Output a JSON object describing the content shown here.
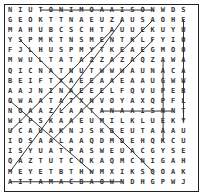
{
  "puzzle": {
    "type": "word-search",
    "rows": 18,
    "cols": 18,
    "grid": [
      "NIUTONIMOAAISONWDS",
      "GEOKTTNAEUZAUSAOHE",
      "MAHUBCSCHTAUUEKUYU",
      "YSPMKTNSMENTKLFYIO",
      "FJLHUSPMYTKEAEGMOO",
      "MWULTATAZZAZAQZAWA",
      "QICNATNUTWWWAUNACA",
      "BEIFTXAEEAAEAAUGWW",
      "AAJNINAEEELFQVUPEB",
      "OWAATATXNVOYAXQPFL",
      "NOAAZLAATANAAISNNT",
      "WLPSKAAEUMILKLUEKY",
      "UCAUAKNJSKBEUTAAAU",
      "IOSAALAAQDMDEHQKCU",
      "ISYUATPASWEUACGYSE",
      "QAZTUTCQKAQMCNIGAH",
      "MEYETBTHWMXIKSQOAK",
      "AITAMACBAOWNDHGPWJ"
    ],
    "found_lines": [
      {
        "from": [
          0,
          3
        ],
        "to": [
          0,
          14
        ],
        "dir": "horizontal"
      },
      {
        "from": [
          10,
          9
        ],
        "to": [
          10,
          16
        ],
        "dir": "horizontal"
      },
      {
        "from": [
          17,
          0
        ],
        "to": [
          17,
          11
        ],
        "dir": "horizontal"
      },
      {
        "from": [
          1,
          17
        ],
        "to": [
          11,
          17
        ],
        "dir": "vertical"
      },
      {
        "from": [
          5,
          15
        ],
        "to": [
          13,
          15
        ],
        "dir": "vertical"
      },
      {
        "from": [
          3,
          1
        ],
        "to": [
          16,
          14
        ],
        "dir": "diagonal-down"
      },
      {
        "from": [
          9,
          0
        ],
        "to": [
          16,
          8
        ],
        "dir": "diagonal-down"
      },
      {
        "from": [
          1,
          11
        ],
        "to": [
          16,
          0
        ],
        "dir": "diagonal-up"
      },
      {
        "from": [
          1,
          14
        ],
        "to": [
          10,
          5
        ],
        "dir": "diagonal-up"
      },
      {
        "from": [
          2,
          10
        ],
        "to": [
          12,
          0
        ],
        "dir": "diagonal-up"
      },
      {
        "from": [
          3,
          14
        ],
        "to": [
          13,
          4
        ],
        "dir": "diagonal-up"
      }
    ],
    "line_color": "#333333"
  }
}
